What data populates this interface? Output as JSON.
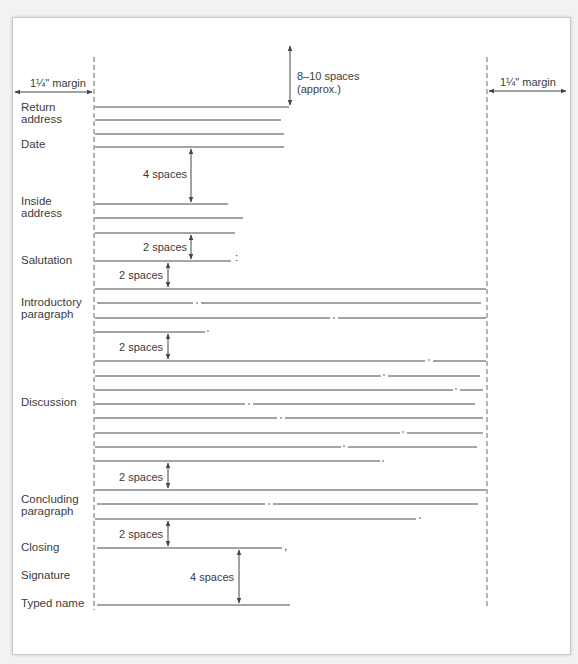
{
  "diagram": {
    "margins": {
      "left_label": "1¼\" margin",
      "right_label": "1¼\" margin"
    },
    "top_spacing": {
      "line1": "8–10 spaces",
      "line2": "(approx.)"
    },
    "sections": [
      {
        "id": "return-address",
        "label_line1": "Return",
        "label_line2": "address"
      },
      {
        "id": "date",
        "label_line1": "Date"
      },
      {
        "id": "inside-address",
        "label_line1": "Inside",
        "label_line2": "address"
      },
      {
        "id": "salutation",
        "label_line1": "Salutation"
      },
      {
        "id": "introductory-paragraph",
        "label_line1": "Introductory",
        "label_line2": "paragraph"
      },
      {
        "id": "discussion",
        "label_line1": "Discussion"
      },
      {
        "id": "concluding-paragraph",
        "label_line1": "Concluding",
        "label_line2": "paragraph"
      },
      {
        "id": "closing",
        "label_line1": "Closing"
      },
      {
        "id": "signature",
        "label_line1": "Signature"
      },
      {
        "id": "typed-name",
        "label_line1": "Typed name"
      }
    ],
    "spacings": {
      "date_to_inside": "4 spaces",
      "inside_to_salutation": "2 spaces",
      "salutation_to_intro": "2 spaces",
      "intro_to_discussion": "2 spaces",
      "discussion_to_concluding": "2 spaces",
      "concluding_to_closing": "2 spaces",
      "closing_to_typed_name": "4 spaces"
    },
    "punctuation": {
      "salutation": ":",
      "closing": ","
    }
  }
}
